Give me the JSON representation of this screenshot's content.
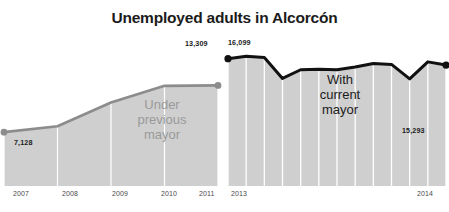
{
  "chart_data": {
    "type": "area",
    "title": "Unemployed adults in Alcorcón",
    "xlabel": "",
    "ylabel": "",
    "grid": true,
    "legend": "none",
    "panels": [
      {
        "name": "under-previous-mayor",
        "annotation": [
          "Under",
          "previous",
          "mayor"
        ],
        "line_color": "#8c8c8c",
        "fill_color": "#cfcfcf",
        "tick_labels": [
          "2007",
          "2008",
          "2009",
          "2010",
          "2011"
        ],
        "x": [
          2007,
          2008,
          2009,
          2010,
          2011
        ],
        "values": [
          7128,
          7900,
          11050,
          13250,
          13309
        ],
        "point_labels": [
          {
            "index": 0,
            "text": "7,128"
          },
          {
            "index": 4,
            "text": "13,309"
          }
        ],
        "ylim": [
          0,
          17200
        ]
      },
      {
        "name": "with-current-mayor",
        "annotation": [
          "With",
          "current",
          "mayor"
        ],
        "line_color": "#111111",
        "fill_color": "#cfcfcf",
        "tick_labels": [
          "2013",
          "2014"
        ],
        "x": [
          0,
          1,
          2,
          3,
          4,
          5,
          6,
          7,
          8,
          9,
          10,
          11,
          12
        ],
        "values": [
          16099,
          16400,
          16250,
          13600,
          14700,
          14780,
          14700,
          15050,
          15500,
          15380,
          13550,
          15700,
          15293
        ],
        "point_labels": [
          {
            "index": 0,
            "text": "16,099"
          },
          {
            "index": 12,
            "text": "15,293"
          }
        ],
        "ylim": [
          0,
          17200
        ]
      }
    ]
  },
  "title": {
    "text": "Unemployed adults in Alcorcón"
  },
  "left_panel": {
    "label_start": "7,128",
    "label_end": "13,309",
    "annotation_line1": "Under",
    "annotation_line2": "previous",
    "annotation_line3": "mayor",
    "tick1": "2007",
    "tick2": "2008",
    "tick3": "2009",
    "tick4": "2010",
    "tick5": "2011"
  },
  "right_panel": {
    "label_start": "16,099",
    "label_end": "15,293",
    "annotation_line1": "With",
    "annotation_line2": "current",
    "annotation_line3": "mayor",
    "tick1": "2013",
    "tick2": "2014"
  },
  "colors": {
    "line_left": "#8c8c8c",
    "line_right": "#111111",
    "fill": "#cfcfcf",
    "text_dark": "#1b1b1b",
    "text_muted": "#9a9a9a"
  }
}
